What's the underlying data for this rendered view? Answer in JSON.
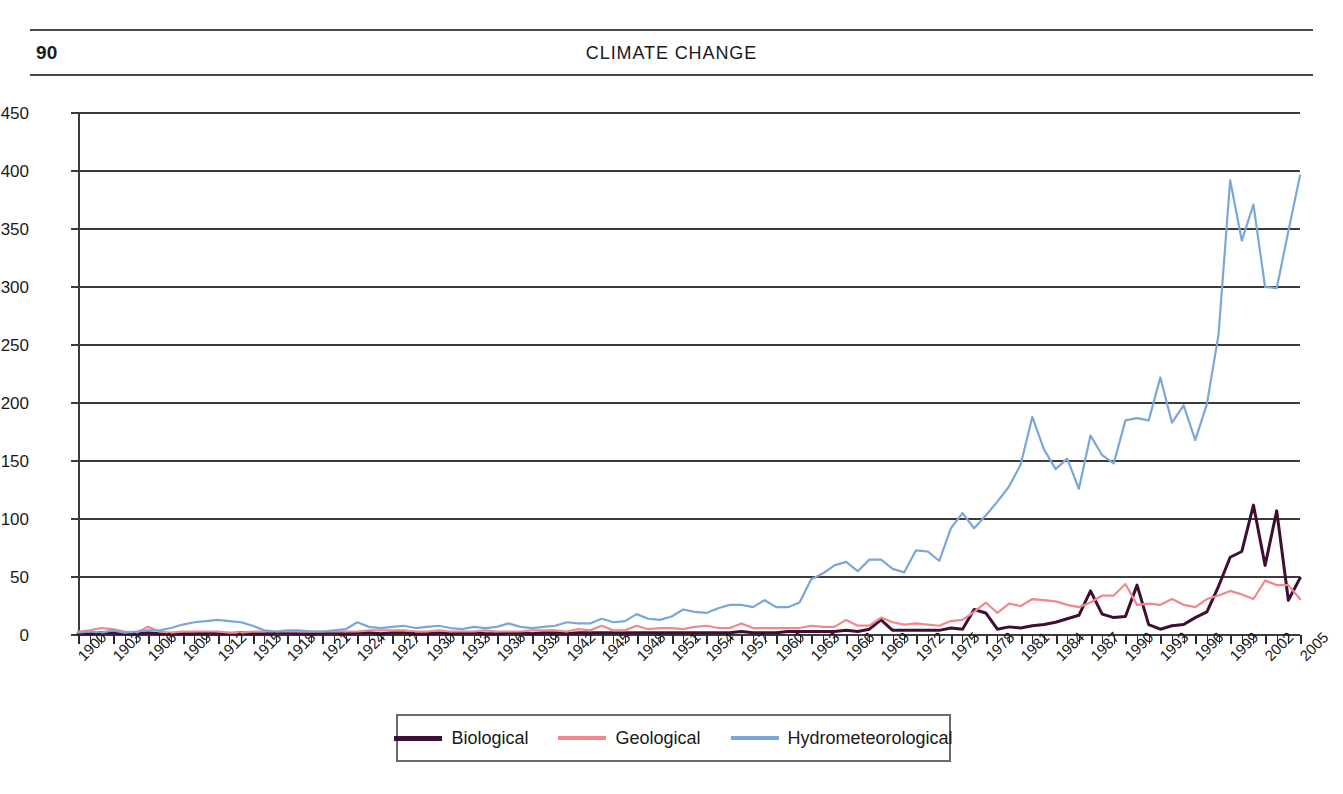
{
  "page": {
    "folio": "90",
    "running_head": "CLIMATE CHANGE"
  },
  "legend": {
    "items": [
      {
        "label": "Biological",
        "color": "#3d0f33"
      },
      {
        "label": "Geological",
        "color": "#f0888c"
      },
      {
        "label": "Hydrometeorological",
        "color": "#7ba7d7"
      }
    ]
  },
  "chart_data": {
    "type": "line",
    "title": "",
    "xlabel": "",
    "ylabel": "",
    "ylim": [
      0,
      450
    ],
    "ytick_step": 50,
    "ytick_labels": [
      "0",
      "50",
      "100",
      "150",
      "200",
      "250",
      "300",
      "350",
      "400",
      "450"
    ],
    "xlim": [
      1900,
      2005
    ],
    "xtick_labels": [
      "1900",
      "1903",
      "1906",
      "1909",
      "1912",
      "1915",
      "1918",
      "1921",
      "1924",
      "1927",
      "1930",
      "1933",
      "1936",
      "1939",
      "1942",
      "1945",
      "1948",
      "1951",
      "1954",
      "1957",
      "1960",
      "1963",
      "1966",
      "1969",
      "1972",
      "1975",
      "1978",
      "1981",
      "1984",
      "1987",
      "1990",
      "1993",
      "1996",
      "1999",
      "2002",
      "2005"
    ],
    "xtick_label_rotation": -45,
    "grid": "horizontal",
    "legend_position": "bottom",
    "x": [
      1900,
      1901,
      1902,
      1903,
      1904,
      1905,
      1906,
      1907,
      1908,
      1909,
      1910,
      1911,
      1912,
      1913,
      1914,
      1915,
      1916,
      1917,
      1918,
      1919,
      1920,
      1921,
      1922,
      1923,
      1924,
      1925,
      1926,
      1927,
      1928,
      1929,
      1930,
      1931,
      1932,
      1933,
      1934,
      1935,
      1936,
      1937,
      1938,
      1939,
      1940,
      1941,
      1942,
      1943,
      1944,
      1945,
      1946,
      1947,
      1948,
      1949,
      1950,
      1951,
      1952,
      1953,
      1954,
      1955,
      1956,
      1957,
      1958,
      1959,
      1960,
      1961,
      1962,
      1963,
      1964,
      1965,
      1966,
      1967,
      1968,
      1969,
      1970,
      1971,
      1972,
      1973,
      1974,
      1975,
      1976,
      1977,
      1978,
      1979,
      1980,
      1981,
      1982,
      1983,
      1984,
      1985,
      1986,
      1987,
      1988,
      1989,
      1990,
      1991,
      1992,
      1993,
      1994,
      1995,
      1996,
      1997,
      1998,
      1999,
      2000,
      2001,
      2002,
      2003,
      2004,
      2005
    ],
    "series": [
      {
        "name": "Biological",
        "color": "#3d0f33",
        "values": [
          1,
          1,
          2,
          2,
          1,
          1,
          2,
          1,
          1,
          1,
          1,
          2,
          1,
          1,
          2,
          1,
          1,
          2,
          2,
          1,
          1,
          2,
          2,
          1,
          2,
          2,
          1,
          2,
          2,
          1,
          1,
          2,
          1,
          2,
          2,
          1,
          1,
          2,
          2,
          1,
          2,
          2,
          1,
          2,
          2,
          2,
          2,
          2,
          2,
          2,
          2,
          2,
          2,
          2,
          2,
          2,
          2,
          3,
          2,
          2,
          2,
          3,
          3,
          3,
          3,
          3,
          4,
          3,
          5,
          13,
          4,
          4,
          4,
          4,
          4,
          6,
          5,
          22,
          19,
          5,
          7,
          6,
          8,
          9,
          11,
          14,
          17,
          38,
          18,
          15,
          16,
          43,
          9,
          5,
          8,
          9,
          15,
          20,
          42,
          67,
          72,
          112,
          60,
          107,
          30,
          49
        ]
      },
      {
        "name": "Geological",
        "color": "#f0888c",
        "values": [
          3,
          4,
          6,
          5,
          3,
          2,
          7,
          3,
          2,
          3,
          3,
          3,
          3,
          2,
          2,
          3,
          3,
          3,
          3,
          3,
          3,
          3,
          3,
          3,
          3,
          4,
          4,
          4,
          4,
          3,
          3,
          4,
          3,
          3,
          3,
          4,
          3,
          3,
          3,
          4,
          4,
          4,
          3,
          5,
          4,
          8,
          4,
          4,
          8,
          5,
          6,
          6,
          5,
          7,
          8,
          6,
          6,
          10,
          6,
          6,
          6,
          6,
          6,
          8,
          7,
          7,
          13,
          8,
          8,
          15,
          11,
          9,
          10,
          9,
          8,
          12,
          13,
          20,
          28,
          19,
          27,
          25,
          31,
          30,
          29,
          26,
          24,
          28,
          34,
          34,
          44,
          26,
          27,
          26,
          31,
          26,
          24,
          31,
          34,
          38,
          35,
          31,
          47,
          43,
          43,
          31
        ]
      },
      {
        "name": "Hydrometeorological",
        "color": "#7ba7d7",
        "values": [
          2,
          3,
          2,
          4,
          2,
          3,
          4,
          4,
          6,
          9,
          11,
          12,
          13,
          12,
          11,
          8,
          4,
          3,
          4,
          4,
          3,
          3,
          4,
          5,
          11,
          7,
          6,
          7,
          8,
          6,
          7,
          8,
          6,
          5,
          7,
          6,
          7,
          10,
          7,
          6,
          7,
          8,
          11,
          10,
          10,
          14,
          11,
          12,
          18,
          14,
          13,
          16,
          22,
          20,
          19,
          23,
          26,
          26,
          24,
          30,
          24,
          24,
          28,
          48,
          53,
          60,
          63,
          55,
          65,
          65,
          57,
          54,
          73,
          72,
          64,
          92,
          105,
          92,
          103,
          115,
          128,
          147,
          188,
          160,
          143,
          152,
          126,
          172,
          155,
          148,
          185,
          187,
          185,
          222,
          183,
          198,
          168,
          199,
          259,
          392,
          340,
          371,
          300,
          299,
          348,
          396
        ]
      }
    ]
  }
}
